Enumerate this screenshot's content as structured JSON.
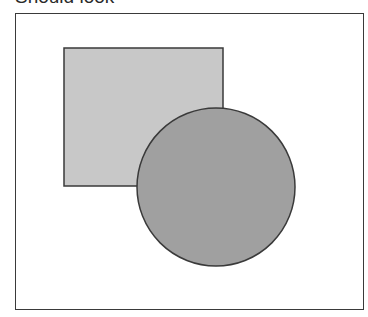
{
  "caption": "Should look",
  "diagram": {
    "square": {
      "x": 64,
      "y": 48,
      "width": 159,
      "height": 138,
      "fill": "#c8c8c8",
      "stroke": "#3a3a3a"
    },
    "circle": {
      "cx": 216,
      "cy": 187,
      "r": 79,
      "fill": "#a0a0a0",
      "stroke": "#3a3a3a"
    }
  }
}
